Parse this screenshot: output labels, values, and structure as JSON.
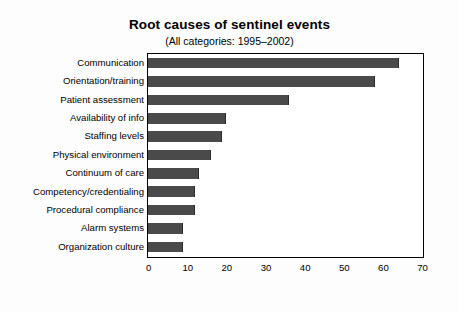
{
  "chart_data": {
    "type": "bar",
    "orientation": "horizontal",
    "title": "Root causes of sentinel events",
    "subtitle": "(All categories: 1995–2002)",
    "xlabel": "",
    "ylabel": "",
    "xlim": [
      0,
      70
    ],
    "xticks": [
      "0",
      "10",
      "20",
      "30",
      "40",
      "50",
      "60",
      "70"
    ],
    "grid": false,
    "legend": false,
    "bar_color": "#4a4a4a",
    "frame_color": "#000000",
    "background": "#ffffff",
    "categories": [
      "Communication",
      "Orientation/training",
      "Patient assessment",
      "Availability of info",
      "Staffing levels",
      "Physical environment",
      "Continuum of care",
      "Competency/credentialing",
      "Procedural compliance",
      "Alarm systems",
      "Organization culture"
    ],
    "values": [
      64,
      58,
      36,
      20,
      19,
      16,
      13,
      12,
      12,
      9,
      9
    ]
  }
}
